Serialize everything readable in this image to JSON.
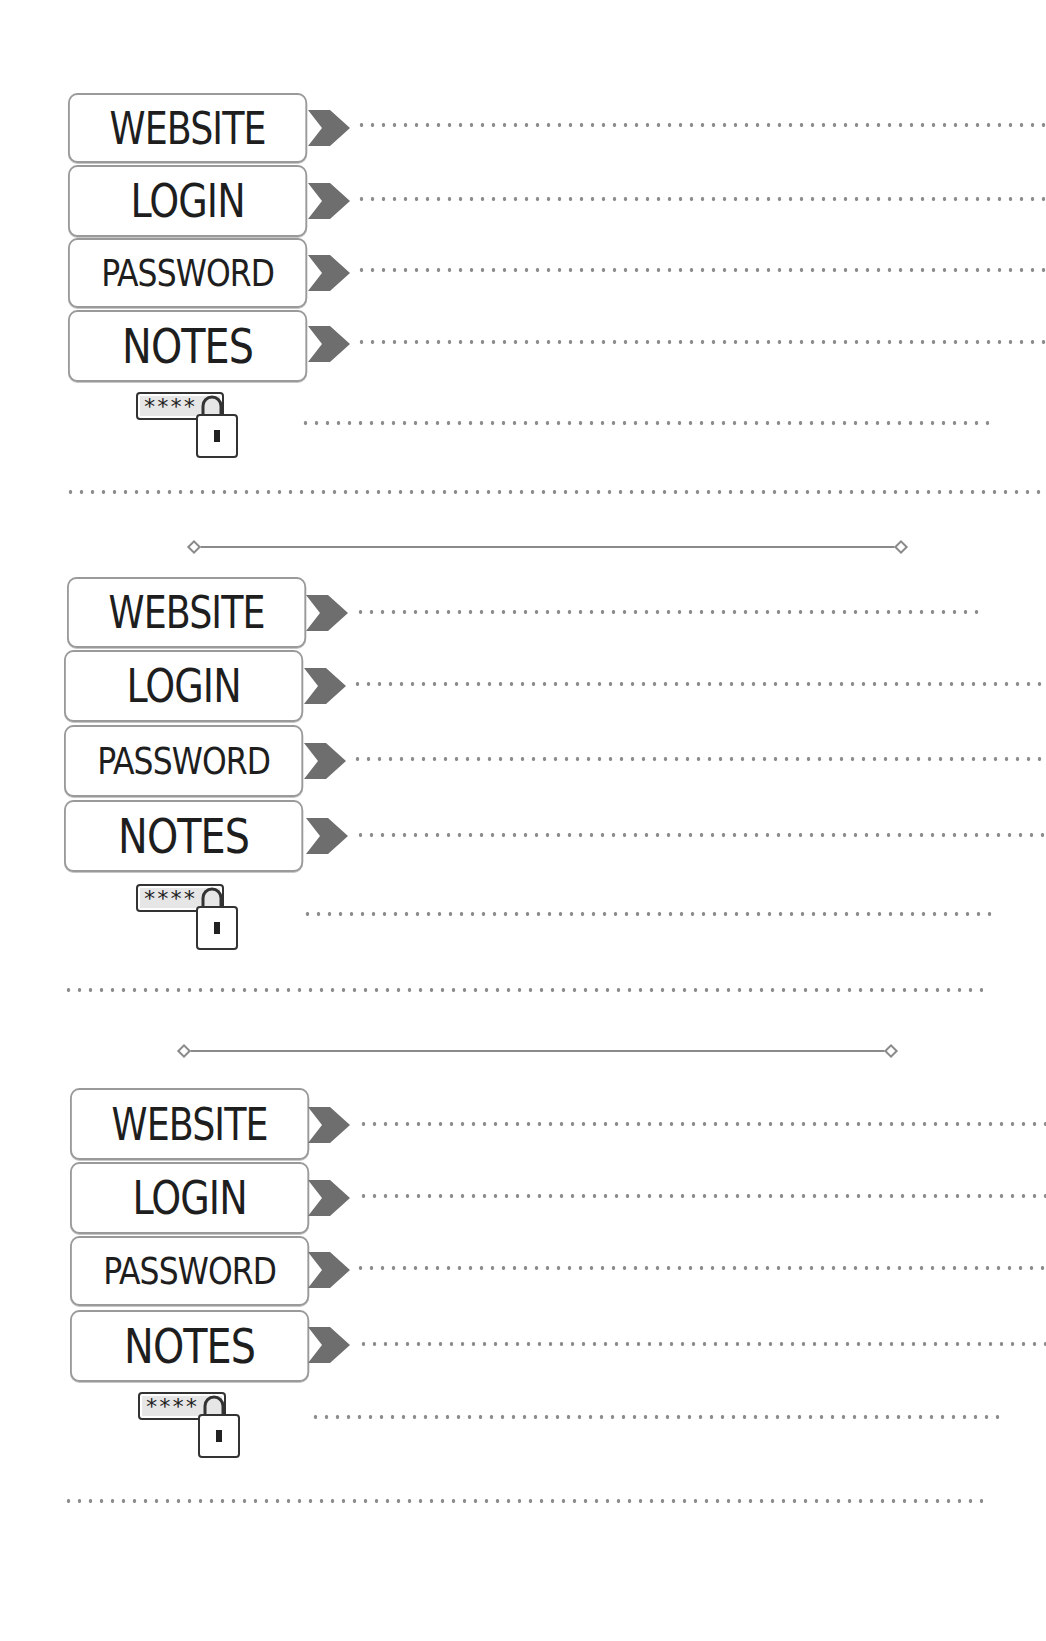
{
  "page": {
    "background": "#ffffff",
    "ink_color": "#1e1e1e",
    "line_color": "#8c8c8c",
    "arrow_color": "#6e6e6e"
  },
  "entries": [
    {
      "fields": [
        {
          "label": "WEBSITE",
          "value": ""
        },
        {
          "label": "LOGIN",
          "value": ""
        },
        {
          "label": "PASSWORD",
          "value": ""
        },
        {
          "label": "NOTES",
          "value": ""
        }
      ],
      "lock_icon": {
        "name": "password-lock-icon",
        "mask_text": "****"
      },
      "extra_line_value": "",
      "separator_line_value": ""
    },
    {
      "fields": [
        {
          "label": "WEBSITE",
          "value": ""
        },
        {
          "label": "LOGIN",
          "value": ""
        },
        {
          "label": "PASSWORD",
          "value": ""
        },
        {
          "label": "NOTES",
          "value": ""
        }
      ],
      "lock_icon": {
        "name": "password-lock-icon",
        "mask_text": "****"
      },
      "extra_line_value": "",
      "separator_line_value": ""
    },
    {
      "fields": [
        {
          "label": "WEBSITE",
          "value": ""
        },
        {
          "label": "LOGIN",
          "value": ""
        },
        {
          "label": "PASSWORD",
          "value": ""
        },
        {
          "label": "NOTES",
          "value": ""
        }
      ],
      "lock_icon": {
        "name": "password-lock-icon",
        "mask_text": "****"
      },
      "extra_line_value": "",
      "separator_line_value": ""
    }
  ]
}
